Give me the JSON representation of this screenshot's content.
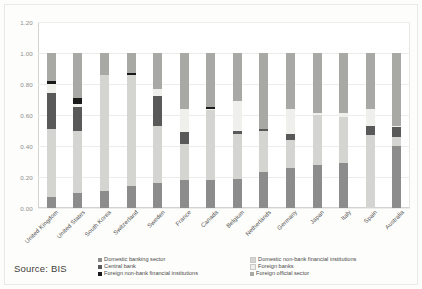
{
  "source_note": "Source: BIS",
  "axis": {
    "y_ticks": [
      "0.00",
      "0.20",
      "0.40",
      "0.60",
      "0.80",
      "1.00",
      "1.20"
    ]
  },
  "legend": {
    "left": [
      {
        "label": "Domestic banking sector",
        "color": "#8c8c8c"
      },
      {
        "label": "Central bank",
        "color": "#595959"
      },
      {
        "label": "Foreign non-bank financial institutions",
        "color": "#1a1a1a"
      }
    ],
    "right": [
      {
        "label": "Domestic non-bank financial institutions",
        "color": "#d4d4d0"
      },
      {
        "label": "Foreign banks",
        "color": "#efefec"
      },
      {
        "label": "Foreign official sector",
        "color": "#a8a8a4"
      }
    ]
  },
  "chart_data": {
    "type": "bar",
    "title": "",
    "xlabel": "",
    "ylabel": "",
    "ylim": [
      0,
      1.2
    ],
    "grid": true,
    "stacked": true,
    "legend_position": "bottom",
    "categories": [
      "United Kingdom",
      "United States",
      "South Korea",
      "Switzerland",
      "Sweden",
      "France",
      "Canada",
      "Belgium",
      "Netherlands",
      "Germany",
      "Japan",
      "Italy",
      "Spain",
      "Australia"
    ],
    "series": [
      {
        "name": "Domestic banking sector",
        "color": "#8c8c8c",
        "values": [
          0.07,
          0.1,
          0.11,
          0.14,
          0.16,
          0.18,
          0.18,
          0.19,
          0.23,
          0.26,
          0.28,
          0.29,
          0.0,
          0.4
        ]
      },
      {
        "name": "Domestic non-bank financial institutions",
        "color": "#d4d4d0",
        "values": [
          0.44,
          0.4,
          0.75,
          0.72,
          0.37,
          0.23,
          0.45,
          0.29,
          0.27,
          0.18,
          0.32,
          0.3,
          0.47,
          0.06
        ]
      },
      {
        "name": "Central bank",
        "color": "#595959",
        "values": [
          0.23,
          0.15,
          0.0,
          0.0,
          0.19,
          0.08,
          0.0,
          0.02,
          0.01,
          0.04,
          0.0,
          0.0,
          0.06,
          0.06
        ]
      },
      {
        "name": "Foreign banks",
        "color": "#efefec",
        "values": [
          0.06,
          0.02,
          0.0,
          0.0,
          0.05,
          0.15,
          0.01,
          0.19,
          0.0,
          0.16,
          0.01,
          0.02,
          0.11,
          0.01
        ]
      },
      {
        "name": "Foreign non-bank financial institutions",
        "color": "#1a1a1a",
        "values": [
          0.02,
          0.04,
          0.0,
          0.01,
          0.0,
          0.0,
          0.01,
          0.0,
          0.0,
          0.0,
          0.0,
          0.0,
          0.0,
          0.0
        ]
      },
      {
        "name": "Foreign official sector",
        "color": "#a8a8a4",
        "values": [
          0.18,
          0.29,
          0.14,
          0.13,
          0.23,
          0.36,
          0.35,
          0.31,
          0.49,
          0.36,
          0.39,
          0.39,
          0.36,
          0.47
        ]
      }
    ],
    "stack_order": [
      "Domestic banking sector",
      "Domestic non-bank financial institutions",
      "Central bank",
      "Foreign banks",
      "Foreign non-bank financial institutions",
      "Foreign official sector"
    ]
  }
}
